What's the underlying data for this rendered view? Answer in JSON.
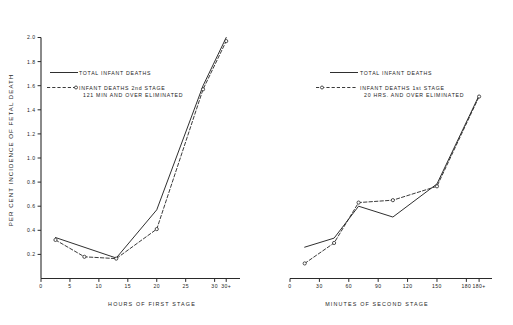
{
  "figure": {
    "y_axis_label": "PER CENT INCIDENCE OF FETAL DEATH",
    "y_ticks": [
      "0.2",
      "0.4",
      "0.6",
      "0.8",
      "1.0",
      "1.2",
      "1.4",
      "1.6",
      "1.8",
      "2.0"
    ]
  },
  "left_panel": {
    "x_axis_title": "HOURS OF FIRST STAGE",
    "x_ticks": [
      "0",
      "5",
      "10",
      "15",
      "20",
      "25",
      "30",
      "30+"
    ],
    "legend": {
      "solid_label": "TOTAL INFANT DEATHS",
      "dashed_label_line1": "INFANT DEATHS 2nd STAGE",
      "dashed_label_line2": "121 MIN AND OVER ELIMINATED"
    }
  },
  "right_panel": {
    "x_axis_title": "MINUTES OF SECOND STAGE",
    "x_ticks": [
      "0",
      "30",
      "60",
      "90",
      "120",
      "150",
      "180",
      "180+"
    ],
    "legend": {
      "solid_label": "TOTAL INFANT DEATHS",
      "dashed_label_line1": "INFANT DEATHS 1st STAGE",
      "dashed_label_line2": "20 HRS. AND OVER ELIMINATED"
    }
  },
  "chart_data": [
    {
      "type": "line",
      "panel": "left",
      "title": "",
      "xlabel": "HOURS OF FIRST STAGE",
      "ylabel": "PER CENT INCIDENCE OF FETAL DEATH",
      "xlim": [
        0,
        33
      ],
      "ylim": [
        0,
        2.0
      ],
      "xticks": [
        0,
        5,
        10,
        15,
        20,
        25,
        30,
        32
      ],
      "xticklabels": [
        "0",
        "5",
        "10",
        "15",
        "20",
        "25",
        "30",
        "30+"
      ],
      "yticks": [
        0.2,
        0.4,
        0.6,
        0.8,
        1.0,
        1.2,
        1.4,
        1.6,
        1.8,
        2.0
      ],
      "grid": false,
      "legend_position": "upper-left-inside",
      "series": [
        {
          "name": "TOTAL INFANT DEATHS",
          "style": "solid",
          "markers": false,
          "x": [
            2.5,
            13,
            20,
            28,
            32
          ],
          "values": [
            0.34,
            0.17,
            0.57,
            1.6,
            2.0
          ]
        },
        {
          "name": "INFANT DEATHS 2nd STAGE 121 MIN AND OVER ELIMINATED",
          "style": "dashed",
          "markers": true,
          "x": [
            2.5,
            7.5,
            13,
            20,
            28,
            32
          ],
          "values": [
            0.32,
            0.18,
            0.165,
            0.41,
            1.57,
            1.97
          ]
        }
      ]
    },
    {
      "type": "line",
      "panel": "right",
      "title": "",
      "xlabel": "MINUTES OF SECOND STAGE",
      "ylabel": "PER CENT INCIDENCE OF FETAL DEATH",
      "xlim": [
        0,
        198
      ],
      "ylim": [
        0,
        2.0
      ],
      "xticks": [
        0,
        30,
        60,
        90,
        120,
        150,
        180,
        193
      ],
      "xticklabels": [
        "0",
        "30",
        "60",
        "90",
        "120",
        "150",
        "180",
        "180+"
      ],
      "yticks": [
        0.2,
        0.4,
        0.6,
        0.8,
        1.0,
        1.2,
        1.4,
        1.6,
        1.8,
        2.0
      ],
      "grid": false,
      "legend_position": "upper-left-inside",
      "series": [
        {
          "name": "TOTAL INFANT DEATHS",
          "style": "solid",
          "markers": false,
          "x": [
            15,
            45,
            70,
            105,
            150,
            193
          ],
          "values": [
            0.26,
            0.335,
            0.6,
            0.51,
            0.785,
            1.52
          ]
        },
        {
          "name": "INFANT DEATHS 1st STAGE 20 HRS. AND OVER ELIMINATED",
          "style": "dashed",
          "markers": true,
          "x": [
            15,
            45,
            70,
            105,
            150,
            193
          ],
          "values": [
            0.125,
            0.295,
            0.63,
            0.65,
            0.765,
            1.51
          ]
        }
      ]
    }
  ]
}
